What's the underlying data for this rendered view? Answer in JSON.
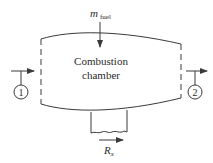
{
  "diagram": {
    "chamber_label_line1": "Combustion",
    "chamber_label_line2": "chamber",
    "fuel_inflow": {
      "symbol": "m",
      "subscript": "fuel"
    },
    "stations": [
      {
        "id": "1",
        "label": "1",
        "position": "inlet"
      },
      {
        "id": "2",
        "label": "2",
        "position": "outlet"
      }
    ],
    "reaction_force": {
      "symbol": "R",
      "subscript": "x"
    },
    "colors": {
      "stroke": "#3a3a3a",
      "background": "#ffffff"
    }
  }
}
